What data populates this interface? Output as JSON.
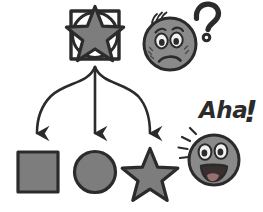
{
  "illustration": {
    "title": "Abstraction to concrete shapes with confused and aha faces",
    "palette": {
      "fill_gray": "#7d7d7d",
      "outline_dark": "#2b2b2b",
      "face_gray": "#8a8a8a",
      "eye_white": "#f2f2f2",
      "mouth_dark": "#3a2f2f",
      "background": "#ffffff"
    },
    "source_node": {
      "name": "composite-abstract-shape",
      "components": [
        "square-outline",
        "circle-outline",
        "star-filled"
      ],
      "x": 70,
      "y": 10,
      "width": 50,
      "height": 50
    },
    "arrows": [
      {
        "name": "arrow-to-square",
        "from_x": 95,
        "from_y": 66,
        "to_x": 37,
        "to_y": 139
      },
      {
        "name": "arrow-to-circle",
        "from_x": 95,
        "from_y": 66,
        "to_x": 95,
        "to_y": 139
      },
      {
        "name": "arrow-to-star",
        "from_x": 95,
        "from_y": 66,
        "to_x": 150,
        "to_y": 139
      }
    ],
    "result_shapes": [
      {
        "name": "square-shape",
        "kind": "square",
        "label": "square",
        "cx": 38,
        "cy": 172
      },
      {
        "name": "circle-shape",
        "kind": "circle",
        "label": "circle",
        "cx": 95,
        "cy": 172
      },
      {
        "name": "star-shape",
        "kind": "star",
        "label": "star",
        "cx": 150,
        "cy": 172
      }
    ],
    "faces": [
      {
        "name": "confused-face",
        "emotion": "confused",
        "cx": 170,
        "cy": 44,
        "radius": 27,
        "annotation": "?",
        "annotation_name": "question-mark"
      },
      {
        "name": "aha-face",
        "emotion": "happy",
        "cx": 213,
        "cy": 160,
        "radius": 25,
        "annotation": "Aha",
        "annotation_punctuation": "!",
        "annotation_name": "aha-exclamation"
      }
    ]
  }
}
